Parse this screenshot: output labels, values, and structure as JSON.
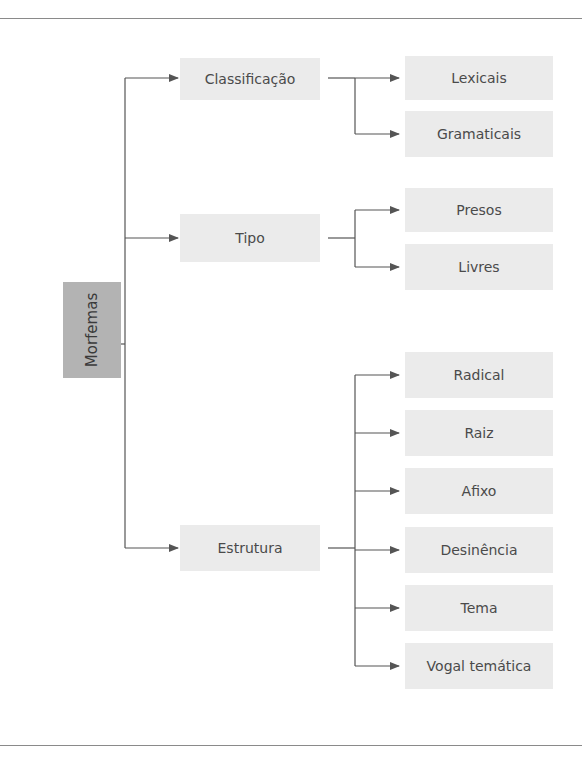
{
  "diagram": {
    "root": {
      "label": "Morfemas"
    },
    "categories": [
      {
        "label": "Classificação",
        "children": [
          "Lexicais",
          "Gramaticais"
        ]
      },
      {
        "label": "Tipo",
        "children": [
          "Presos",
          "Livres"
        ]
      },
      {
        "label": "Estrutura",
        "children": [
          "Radical",
          "Raiz",
          "Afixo",
          "Desinência",
          "Tema",
          "Vogal temática"
        ]
      }
    ]
  },
  "colors": {
    "root_fill": "#b3b3b3",
    "node_fill": "#ebebeb",
    "line": "#555555",
    "text": "#4a4a4a"
  }
}
